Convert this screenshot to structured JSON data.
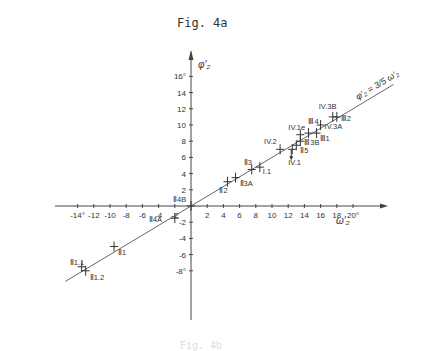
{
  "figure": {
    "title": "Fig. 4a",
    "bottom_caption": "Fig. 4b"
  },
  "chart_data": {
    "type": "scatter",
    "title": "Fig. 4a",
    "xlabel": "ω'₂",
    "ylabel": "φ'₂",
    "xlim": [
      -15,
      22
    ],
    "ylim": [
      -9,
      17
    ],
    "x_ticks": [
      -14,
      -12,
      -10,
      -8,
      -6,
      -4,
      -2,
      2,
      4,
      6,
      8,
      10,
      12,
      14,
      16,
      18,
      20
    ],
    "x_tick_labels": [
      "-14°",
      "-12",
      "-10",
      "-8",
      "-6",
      "-4",
      "-2",
      "2",
      "4",
      "6",
      "8",
      "10",
      "12",
      "14",
      "16",
      "18",
      "20°"
    ],
    "y_ticks": [
      -8,
      -6,
      -4,
      -2,
      2,
      4,
      6,
      8,
      10,
      12,
      14,
      16
    ],
    "y_tick_labels": [
      "-8°",
      "-6",
      "-4",
      "-2",
      "2",
      "4",
      "6",
      "8",
      "10",
      "12",
      "14",
      "16°"
    ],
    "grid": false,
    "fit_line": {
      "label": "φ'₂ = 3/5 ω'₂",
      "slope": 0.6,
      "x_range": [
        -15,
        25
      ]
    },
    "points": [
      {
        "label": "Ⅱ4B",
        "x": 0.0,
        "y": 0.0
      },
      {
        "label": "Ⅱ4A",
        "x": -2.0,
        "y": -1.5
      },
      {
        "label": "Ⅱ1",
        "x": -9.5,
        "y": -5.0
      },
      {
        "label": "Ⅱ1.1",
        "x": -13.5,
        "y": -7.5
      },
      {
        "label": "Ⅱ1.2",
        "x": -13.0,
        "y": -8.0
      },
      {
        "label": "Ⅱ2",
        "x": 4.5,
        "y": 3.0
      },
      {
        "label": "Ⅱ3A",
        "x": 5.5,
        "y": 3.5
      },
      {
        "label": "Ⅱ3",
        "x": 7.5,
        "y": 4.5
      },
      {
        "label": "I.1",
        "x": 8.5,
        "y": 4.8
      },
      {
        "label": "IV.2",
        "x": 11.0,
        "y": 7.0
      },
      {
        "label": "IV.1",
        "x": 12.5,
        "y": 7.0
      },
      {
        "label": "Ⅱ5",
        "x": 13.0,
        "y": 7.5
      },
      {
        "label": "Ⅲ3B",
        "x": 13.5,
        "y": 8.0
      },
      {
        "label": "IV.1e",
        "x": 13.5,
        "y": 8.8
      },
      {
        "label": "Ⅲ4",
        "x": 14.5,
        "y": 9.0
      },
      {
        "label": "Ⅲ1",
        "x": 15.5,
        "y": 9.0
      },
      {
        "label": "IV.3A",
        "x": 16.0,
        "y": 10.0
      },
      {
        "label": "IV.3B",
        "x": 17.5,
        "y": 11.0
      },
      {
        "label": "Ⅲ2",
        "x": 18.0,
        "y": 11.0
      }
    ]
  }
}
